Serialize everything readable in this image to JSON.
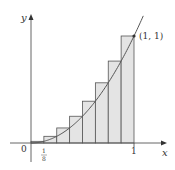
{
  "diagram": {
    "type": "riemann-sum-right-endpoints",
    "function": "y = x^2",
    "n_rectangles": 8,
    "interval": [
      0,
      1
    ],
    "rect_heights": [
      0.015625,
      0.0625,
      0.140625,
      0.25,
      0.390625,
      0.5625,
      0.765625,
      1.0
    ],
    "labels": {
      "x_axis": "x",
      "y_axis": "y",
      "origin": "0",
      "tick_one": "1",
      "tick_eighth_num": "1",
      "tick_eighth_den": "8",
      "point": "(1, 1)"
    },
    "colors": {
      "rect_fill": "#e4e4e4",
      "rect_stroke": "#555555",
      "curve": "#555555",
      "axis": "#555555"
    }
  }
}
